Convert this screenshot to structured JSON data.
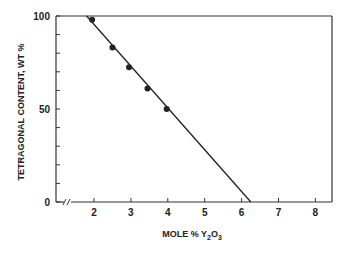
{
  "chart_data": {
    "type": "scatter",
    "title": "",
    "xlabel": "MOLE % Y2O3",
    "xlabel_parts": {
      "main": "MOLE % Y",
      "sub1": "2",
      "mid": "O",
      "sub2": "3"
    },
    "ylabel": "TETRAGONAL CONTENT, WT %",
    "xlim": [
      1.0,
      8.45
    ],
    "ylim": [
      0,
      100
    ],
    "x_axis_break": true,
    "x_ticks": [
      2,
      3,
      4,
      5,
      6,
      7,
      8
    ],
    "x_tick_labels": [
      "2",
      "3",
      "4",
      "5",
      "6",
      "7",
      "8"
    ],
    "y_ticks": [
      0,
      10,
      20,
      30,
      40,
      50,
      60,
      70,
      80,
      90,
      100
    ],
    "y_tick_labels": [
      {
        "value": 0,
        "label": "0"
      },
      {
        "value": 50,
        "label": "50"
      },
      {
        "value": 100,
        "label": "100"
      }
    ],
    "grid": false,
    "legend": null,
    "series": [
      {
        "name": "measured",
        "type": "scatter",
        "marker": "filled-circle",
        "color": "#222222",
        "points": [
          {
            "x": 1.95,
            "y": 98
          },
          {
            "x": 2.5,
            "y": 83
          },
          {
            "x": 2.95,
            "y": 72.5
          },
          {
            "x": 3.45,
            "y": 61
          },
          {
            "x": 3.97,
            "y": 50
          }
        ]
      },
      {
        "name": "linear fit",
        "type": "line",
        "color": "#222222",
        "points": [
          {
            "x": 1.8,
            "y": 100
          },
          {
            "x": 6.25,
            "y": 0
          }
        ]
      }
    ]
  }
}
